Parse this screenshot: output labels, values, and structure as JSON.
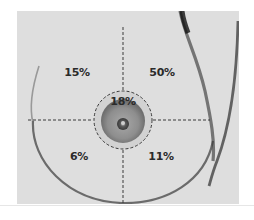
{
  "figure": {
    "quadrants": {
      "upper_left": {
        "label": "15%"
      },
      "upper_right": {
        "label": "50%"
      },
      "central": {
        "label": "18%"
      },
      "lower_left": {
        "label": "6%"
      },
      "lower_right": {
        "label": "11%"
      }
    },
    "colors": {
      "background": "#dcdcdc",
      "outline": "#3a3a3a",
      "areola": "#8a8a8a",
      "dashed_line": "#3a3a3a"
    }
  }
}
